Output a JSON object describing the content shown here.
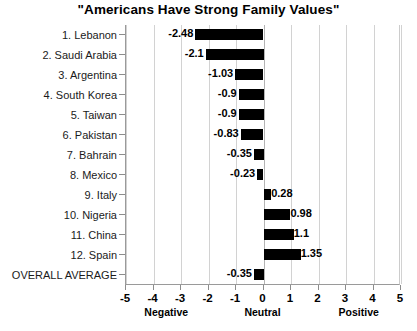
{
  "chart_data": {
    "type": "bar",
    "orientation": "horizontal",
    "title": "\"Americans Have Strong Family Values\"",
    "xlabel": "",
    "ylabel": "",
    "xlim": [
      -5,
      5
    ],
    "xticks": [
      -5,
      -4,
      -3,
      -2,
      -1,
      0,
      1,
      2,
      3,
      4,
      5
    ],
    "xtick_labels": [
      "-5",
      "-4",
      "-3",
      "-2",
      "-1",
      "0",
      "1",
      "2",
      "3",
      "4",
      "5"
    ],
    "axis_group_labels": [
      {
        "text": "Negative",
        "at": -3.5
      },
      {
        "text": "Neutral",
        "at": 0
      },
      {
        "text": "Positive",
        "at": 3.5
      }
    ],
    "grid": true,
    "legend": false,
    "bar_color": "#000000",
    "categories": [
      "1. Lebanon",
      "2. Saudi Arabia",
      "3. Argentina",
      "4. South Korea",
      "5. Taiwan",
      "6. Pakistan",
      "7. Bahrain",
      "8. Mexico",
      "9. Italy",
      "10. Nigeria",
      "11. China",
      "12. Spain",
      "OVERALL AVERAGE"
    ],
    "values": [
      -2.48,
      -2.1,
      -1.03,
      -0.9,
      -0.9,
      -0.83,
      -0.35,
      -0.23,
      0.28,
      0.98,
      1.1,
      1.35,
      -0.35
    ],
    "value_labels": [
      "-2.48",
      "-2.1",
      "-1.03",
      "-0.9",
      "-0.9",
      "-0.83",
      "-0.35",
      "-0.23",
      "0.28",
      "0.98",
      "1.1",
      "1.35",
      "-0.35"
    ]
  }
}
